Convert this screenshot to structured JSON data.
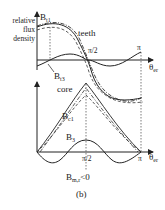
{
  "diagram": {
    "caption": "(b)",
    "top_panel": {
      "y_axis_label": "relative flux density",
      "y_label_lines": [
        "relative",
        "flux",
        "density"
      ],
      "curve_labels": {
        "b_t1": {
          "base": "B",
          "sub": "t1"
        },
        "teeth": "teeth",
        "b_t3": {
          "base": "B",
          "sub": "t3"
        }
      },
      "x_ticks": {
        "half_pi": "π/2",
        "pi": "π"
      },
      "x_axis_label": {
        "base": "θ",
        "sub": "er"
      }
    },
    "bottom_panel": {
      "curve_labels": {
        "core": "core",
        "b_c1": {
          "base": "B",
          "sub": "c1"
        },
        "b_3": {
          "base": "B",
          "sub": "3"
        }
      },
      "x_ticks": {
        "half_pi": "π/2",
        "pi": "π"
      },
      "x_axis_label": {
        "base": "θ",
        "sub": "er"
      },
      "annotation": {
        "base": "B",
        "sub": "m,r",
        "suffix": "<0"
      }
    },
    "colors": {
      "line": "#222222",
      "dashed": "#333333",
      "background": "#ffffff"
    }
  }
}
